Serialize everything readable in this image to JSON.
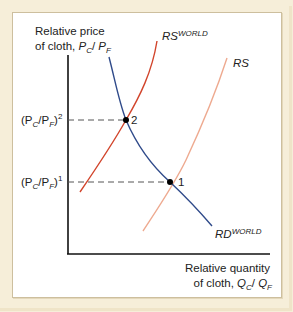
{
  "diagram": {
    "y_axis_label_line1": "Relative price",
    "y_axis_label_line2_prefix": "of cloth, ",
    "y_axis_label_var": "P",
    "y_axis_label_sub1": "C",
    "y_axis_label_sep": "/ ",
    "y_axis_label_sub2": "F",
    "x_axis_label_line1": "Relative quantity",
    "x_axis_label_line2_prefix": "of cloth, ",
    "x_axis_label_var": "Q",
    "x_axis_label_sub1": "C",
    "x_axis_label_sub2": "F",
    "price_level_2": {
      "base": "(P",
      "sub1": "C",
      "mid": "/P",
      "sub2": "F",
      "close": ")",
      "sup": "2"
    },
    "price_level_1": {
      "base": "(P",
      "sub1": "C",
      "mid": "/P",
      "sub2": "F",
      "close": ")",
      "sup": "1"
    },
    "curves": [
      {
        "id": "rs-world",
        "label": "RS",
        "superscript": "WORLD",
        "color": "#d2452c"
      },
      {
        "id": "rs",
        "label": "RS",
        "superscript": "",
        "color": "#eeaa90"
      },
      {
        "id": "rd-world",
        "label": "RD",
        "superscript": "WORLD",
        "color": "#2f4a8a"
      }
    ],
    "points": [
      {
        "id": "2",
        "label": "2",
        "description": "intersection of RS-WORLD and RD-WORLD at (PC/PF)^2"
      },
      {
        "id": "1",
        "label": "1",
        "description": "intersection of RS and RD-WORLD at (PC/PF)^1"
      }
    ]
  }
}
